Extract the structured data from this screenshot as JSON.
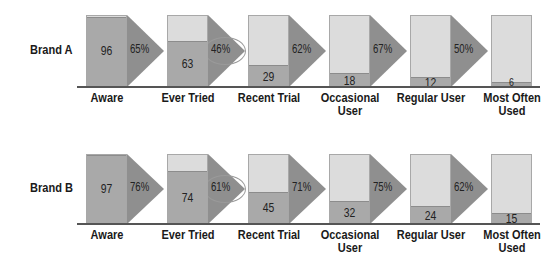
{
  "chart_data": {
    "type": "bar",
    "title": "",
    "xlabel": "",
    "ylabel": "",
    "ylim": [
      0,
      100
    ],
    "categories": [
      "Aware",
      "Ever Tried",
      "Recent Trial",
      "Occasional User",
      "Regular User",
      "Most Often Used"
    ],
    "category_labels": [
      [
        "Aware"
      ],
      [
        "Ever Tried"
      ],
      [
        "Recent Trial"
      ],
      [
        "Occasional",
        "User"
      ],
      [
        "Regular User"
      ],
      [
        "Most Often",
        "Used"
      ]
    ],
    "series": [
      {
        "name": "Brand A",
        "values": [
          96,
          63,
          29,
          18,
          12,
          6
        ],
        "conversion": [
          "65%",
          "46%",
          "62%",
          "67%",
          "50%"
        ],
        "highlighted_conversion_index": 1
      },
      {
        "name": "Brand B",
        "values": [
          97,
          74,
          45,
          32,
          24,
          15
        ],
        "conversion": [
          "76%",
          "61%",
          "71%",
          "75%",
          "62%"
        ],
        "highlighted_conversion_index": 1
      }
    ],
    "grid": false,
    "legend": "none"
  },
  "colors": {
    "box_empty": "#dcdcdc",
    "box_fill": "#a9a9a9",
    "arrow": "#8f8f8f",
    "baseline": "#555555",
    "highlight_ellipse": "#9a9a9a"
  }
}
